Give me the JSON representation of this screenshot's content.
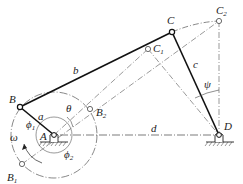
{
  "diagram": {
    "type": "four-bar crank-rocker mechanism",
    "points": {
      "A": {
        "label": "A",
        "x": 54,
        "y": 135
      },
      "B": {
        "label": "B",
        "x": 20,
        "y": 107
      },
      "B1": {
        "label": "B",
        "sub": "1",
        "x": 22,
        "y": 164
      },
      "B2": {
        "label": "B",
        "sub": "2",
        "x": 90,
        "y": 109
      },
      "C": {
        "label": "C",
        "x": 172,
        "y": 32
      },
      "C1": {
        "label": "C",
        "sub": "1",
        "x": 148,
        "y": 49
      },
      "C2": {
        "label": "C",
        "sub": "2",
        "x": 219,
        "y": 21
      },
      "D": {
        "label": "D",
        "x": 219,
        "y": 135
      }
    },
    "links": {
      "a": "a",
      "b": "b",
      "c": "c",
      "d": "d"
    },
    "angles": {
      "theta": "θ",
      "psi": "ψ",
      "phi1": "ϕ",
      "phi1_sub": "1",
      "phi2": "ϕ",
      "phi2_sub": "2",
      "omega": "ω"
    },
    "colors": {
      "line": "#222222",
      "background": "#ffffff"
    }
  }
}
